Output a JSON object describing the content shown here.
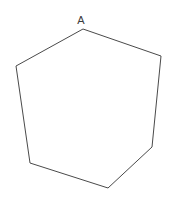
{
  "figure": {
    "background_color": "#ffffff",
    "width": 170,
    "height": 203,
    "shape": {
      "name": "hexagon",
      "sides": 6,
      "stroke_color": "#4a4a4a",
      "fill_color": "#ffffff",
      "stroke_width": 1,
      "points": "83,29 161,56 152,147 108,188 30,163 16,66",
      "vertices": [
        {
          "name": "A",
          "x": 83,
          "y": 29
        },
        {
          "name": "upper-right",
          "x": 161,
          "y": 56
        },
        {
          "name": "lower-right",
          "x": 152,
          "y": 147
        },
        {
          "name": "bottom",
          "x": 108,
          "y": 188
        },
        {
          "name": "lower-left",
          "x": 30,
          "y": 163
        },
        {
          "name": "upper-left",
          "x": 16,
          "y": 66
        }
      ]
    },
    "labels": [
      {
        "id": "vertex-a",
        "text": "A",
        "x": 81,
        "y": 24,
        "color": "#3c3c3c",
        "font_size": 11
      }
    ]
  }
}
